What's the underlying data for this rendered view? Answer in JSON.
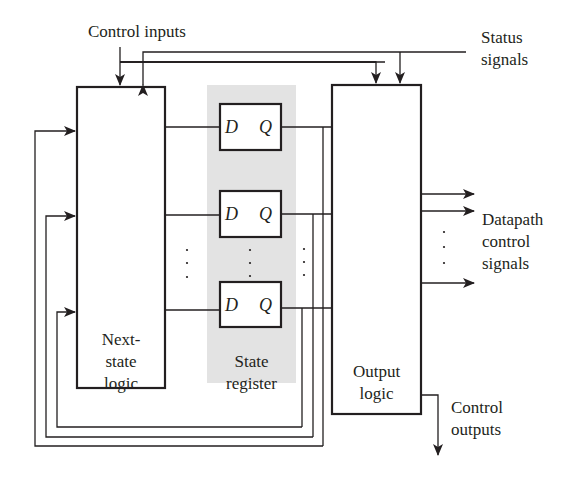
{
  "diagram": {
    "colors": {
      "line": "#231f20",
      "state_register_fill": "#e3e3e3",
      "background": "#ffffff"
    },
    "labels": {
      "control_inputs": "Control inputs",
      "status_signals_1": "Status",
      "status_signals_2": "signals",
      "datapath_1": "Datapath",
      "datapath_2": "control",
      "datapath_3": "signals",
      "control_outputs_1": "Control",
      "control_outputs_2": "outputs"
    },
    "blocks": {
      "next_state": {
        "line1": "Next-",
        "line2": "state",
        "line3": "logic"
      },
      "state_register": {
        "line1": "State",
        "line2": "register"
      },
      "output_logic": {
        "line1": "Output",
        "line2": "logic"
      }
    },
    "flip_flops": [
      {
        "d": "D",
        "q": "Q"
      },
      {
        "d": "D",
        "q": "Q"
      },
      {
        "d": "D",
        "q": "Q"
      }
    ],
    "ellipsis": "·"
  }
}
